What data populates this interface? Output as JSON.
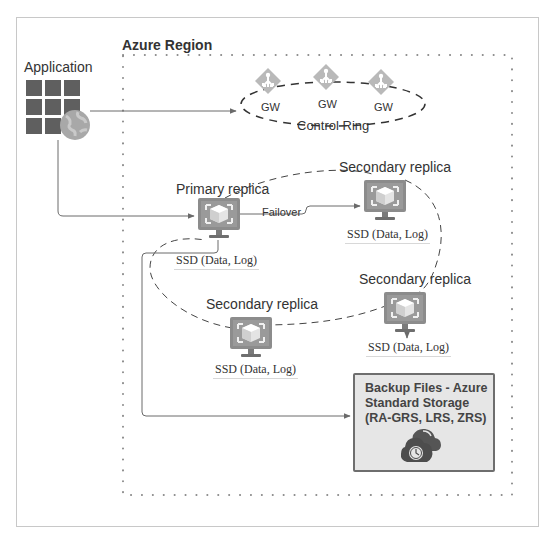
{
  "diagram": {
    "region_title": "Azure Region",
    "application": {
      "label": "Application",
      "icon": "web-app-grid-globe-icon"
    },
    "control_ring": {
      "label": "Control Ring",
      "gateways": [
        {
          "label": "GW",
          "icon": "gateway-icon"
        },
        {
          "label": "GW",
          "icon": "gateway-icon"
        },
        {
          "label": "GW",
          "icon": "gateway-icon"
        }
      ]
    },
    "replicas": [
      {
        "role": "Primary replica",
        "storage": "SSD (Data, Log)",
        "icon": "vm-monitor-icon"
      },
      {
        "role": "Secondary replica",
        "storage": "SSD (Data, Log)",
        "icon": "vm-monitor-icon"
      },
      {
        "role": "Secondary replica",
        "storage": "SSD (Data, Log)",
        "icon": "vm-monitor-icon"
      },
      {
        "role": "Secondary replica",
        "storage": "SSD (Data, Log)",
        "icon": "vm-monitor-icon"
      }
    ],
    "failover_label": "Failover",
    "backup": {
      "line1": "Backup Files - Azure",
      "line2": "Standard Storage",
      "line3": "(RA-GRS, LRS, ZRS)",
      "icon": "cloud-backup-clock-icon"
    },
    "colors": {
      "icon_gray": "#8c8c8c",
      "icon_light": "#bdbdbd",
      "line": "#6a6a6a",
      "backup_fill": "#e6e6e6",
      "backup_border": "#6e6e6e",
      "frame_border": "#c8c8c8"
    }
  }
}
